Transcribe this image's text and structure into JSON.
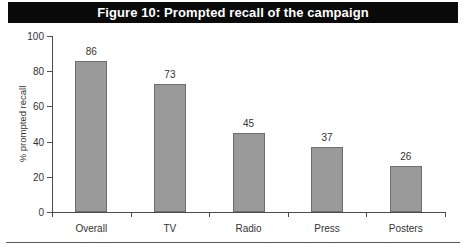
{
  "figure": {
    "title": "Figure 10: Prompted recall of the campaign",
    "title_bar_color": "#0a0a0a",
    "title_text_color": "#ffffff",
    "background_color": "#ffffff"
  },
  "chart_data": {
    "type": "bar",
    "title": "Figure 10: Prompted recall of the campaign",
    "categories": [
      "Overall",
      "TV",
      "Radio",
      "Press",
      "Posters"
    ],
    "values": [
      86,
      73,
      45,
      37,
      26
    ],
    "data_labels": [
      "86",
      "73",
      "45",
      "37",
      "26"
    ],
    "xlabel": "",
    "ylabel": "% prompted recall",
    "ylim": [
      0,
      100
    ],
    "yticks": [
      0,
      20,
      40,
      60,
      80,
      100
    ],
    "ytick_labels": [
      "0",
      "20",
      "40",
      "60",
      "80",
      "100"
    ],
    "grid": false,
    "legend": false,
    "bar_color": "#9a9a9a",
    "bar_border_color": "#6e6e6e",
    "axis_color": "#4d4d4d"
  }
}
